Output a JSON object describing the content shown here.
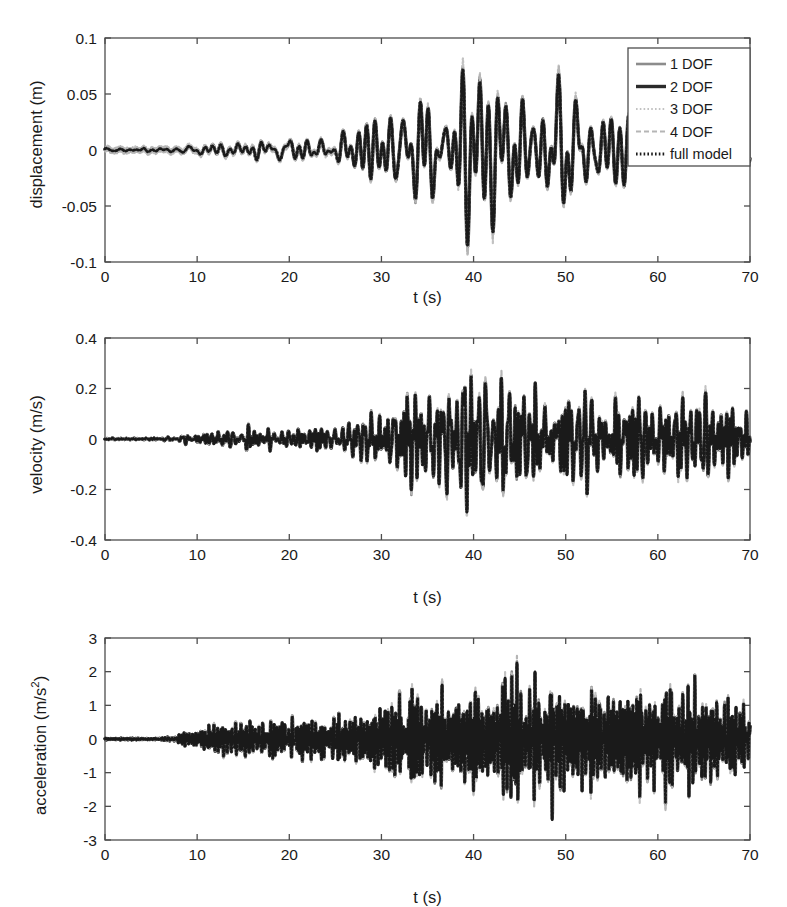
{
  "figure": {
    "background": "#ffffff",
    "axis_color": "#4d4d4d"
  },
  "legend": {
    "position": "top-right-panel-1",
    "entries": [
      {
        "label": "1 DOF",
        "color": "#8c8c8c",
        "style": "solid",
        "width": 2.6
      },
      {
        "label": "2 DOF",
        "color": "#2b2b2b",
        "style": "solid",
        "width": 3.4
      },
      {
        "label": "3 DOF",
        "color": "#c2c2c2",
        "style": "dotted",
        "width": 2.2
      },
      {
        "label": "4 DOF",
        "color": "#b5b5b5",
        "style": "dashed",
        "width": 2.2
      },
      {
        "label": "full model",
        "color": "#1a1a1a",
        "style": "dotted",
        "width": 2.8
      }
    ]
  },
  "chart_data": [
    {
      "type": "line",
      "title": "",
      "panel": 1,
      "xlabel": "t (s)",
      "ylabel": "displacement (m)",
      "xlim": [
        0,
        70
      ],
      "ylim": [
        -0.1,
        0.1
      ],
      "xticks": [
        0,
        10,
        20,
        30,
        40,
        50,
        60,
        70
      ],
      "xticklabels": [
        "0",
        "10",
        "20",
        "30",
        "40",
        "50",
        "60",
        "70"
      ],
      "yticks": [
        -0.1,
        -0.05,
        0,
        0.05,
        0.1
      ],
      "yticklabels": [
        "-0.1",
        "-0.05",
        "0",
        "0.05",
        "0.1"
      ],
      "grid": false,
      "legend_entries": [
        "1 DOF",
        "2 DOF",
        "3 DOF",
        "4 DOF",
        "full model"
      ],
      "description": "Near-zero until t=8s, slow growth to t=30s, strong irregular low-frequency oscillation peaking near t=36-39s with max +0.075 and min -0.085, decaying after t=58s.",
      "envelope": [
        {
          "t": 0,
          "amp": 0.0015
        },
        {
          "t": 6,
          "amp": 0.0015
        },
        {
          "t": 9,
          "amp": 0.004
        },
        {
          "t": 12,
          "amp": 0.007
        },
        {
          "t": 15,
          "amp": 0.01
        },
        {
          "t": 18,
          "amp": 0.012
        },
        {
          "t": 21,
          "amp": 0.011
        },
        {
          "t": 24,
          "amp": 0.013
        },
        {
          "t": 27,
          "amp": 0.014
        },
        {
          "t": 30,
          "amp": 0.022
        },
        {
          "t": 32,
          "amp": 0.048
        },
        {
          "t": 34,
          "amp": 0.04
        },
        {
          "t": 36,
          "amp": 0.07
        },
        {
          "t": 38,
          "amp": 0.062
        },
        {
          "t": 39,
          "amp": 0.085
        },
        {
          "t": 41,
          "amp": 0.055
        },
        {
          "t": 43,
          "amp": 0.045
        },
        {
          "t": 45,
          "amp": 0.052
        },
        {
          "t": 47,
          "amp": 0.04
        },
        {
          "t": 49,
          "amp": 0.046
        },
        {
          "t": 51,
          "amp": 0.036
        },
        {
          "t": 53,
          "amp": 0.04
        },
        {
          "t": 55,
          "amp": 0.03
        },
        {
          "t": 57,
          "amp": 0.033
        },
        {
          "t": 59,
          "amp": 0.016
        },
        {
          "t": 62,
          "amp": 0.013
        },
        {
          "t": 65,
          "amp": 0.011
        },
        {
          "t": 68,
          "amp": 0.012
        },
        {
          "t": 70,
          "amp": 0.01
        }
      ],
      "base_freq": 0.62,
      "seed": 17
    },
    {
      "type": "line",
      "title": "",
      "panel": 2,
      "xlabel": "t (s)",
      "ylabel": "velocity (m/s)",
      "xlim": [
        0,
        70
      ],
      "ylim": [
        -0.4,
        0.4
      ],
      "xticks": [
        0,
        10,
        20,
        30,
        40,
        50,
        60,
        70
      ],
      "xticklabels": [
        "0",
        "10",
        "20",
        "30",
        "40",
        "50",
        "60",
        "70"
      ],
      "yticks": [
        -0.4,
        -0.2,
        0,
        0.2,
        0.4
      ],
      "yticklabels": [
        "-0.4",
        "-0.2",
        "0",
        "0.2",
        "0.4"
      ],
      "grid": false,
      "description": "Flat until t=8s, moderate growth to t=30s, then dense oscillation with peaks near +0.29 around t=44 and troughs near -0.27, sustained through t=70.",
      "envelope": [
        {
          "t": 0,
          "amp": 0.004
        },
        {
          "t": 6,
          "amp": 0.004
        },
        {
          "t": 9,
          "amp": 0.02
        },
        {
          "t": 12,
          "amp": 0.035
        },
        {
          "t": 15,
          "amp": 0.05
        },
        {
          "t": 18,
          "amp": 0.055
        },
        {
          "t": 21,
          "amp": 0.05
        },
        {
          "t": 24,
          "amp": 0.06
        },
        {
          "t": 27,
          "amp": 0.07
        },
        {
          "t": 30,
          "amp": 0.11
        },
        {
          "t": 32,
          "amp": 0.21
        },
        {
          "t": 34,
          "amp": 0.18
        },
        {
          "t": 36,
          "amp": 0.23
        },
        {
          "t": 38,
          "amp": 0.2
        },
        {
          "t": 40,
          "amp": 0.225
        },
        {
          "t": 42,
          "amp": 0.2
        },
        {
          "t": 44,
          "amp": 0.29
        },
        {
          "t": 46,
          "amp": 0.21
        },
        {
          "t": 48,
          "amp": 0.235
        },
        {
          "t": 50,
          "amp": 0.2
        },
        {
          "t": 52,
          "amp": 0.215
        },
        {
          "t": 54,
          "amp": 0.185
        },
        {
          "t": 56,
          "amp": 0.2
        },
        {
          "t": 58,
          "amp": 0.175
        },
        {
          "t": 60,
          "amp": 0.185
        },
        {
          "t": 62,
          "amp": 0.165
        },
        {
          "t": 64,
          "amp": 0.18
        },
        {
          "t": 66,
          "amp": 0.16
        },
        {
          "t": 68,
          "amp": 0.175
        },
        {
          "t": 70,
          "amp": 0.15
        }
      ],
      "base_freq": 1.55,
      "seed": 41
    },
    {
      "type": "line",
      "title": "",
      "panel": 3,
      "xlabel": "t (s)",
      "ylabel": "acceleration (m/s2)",
      "ylabel_sup": "2",
      "ylabel_prefix": "acceleration (m/s",
      "ylabel_suffix": ")",
      "xlim": [
        0,
        70
      ],
      "ylim": [
        -3,
        3
      ],
      "xticks": [
        0,
        10,
        20,
        30,
        40,
        50,
        60,
        70
      ],
      "xticklabels": [
        "0",
        "10",
        "20",
        "30",
        "40",
        "50",
        "60",
        "70"
      ],
      "yticks": [
        -3,
        -2,
        -1,
        0,
        1,
        2,
        3
      ],
      "yticklabels": [
        "-3",
        "-2",
        "-1",
        "0",
        "1",
        "2",
        "3"
      ],
      "grid": false,
      "description": "Flat until t=8s, rapid high-frequency oscillation growing steadily; densest band from t=30 onward with peaks near +2.4 at t=49 and troughs near -2.3 at t=44, sustained to t=70.",
      "envelope": [
        {
          "t": 0,
          "amp": 0.03
        },
        {
          "t": 6,
          "amp": 0.03
        },
        {
          "t": 8,
          "amp": 0.15
        },
        {
          "t": 10,
          "amp": 0.4
        },
        {
          "t": 12,
          "amp": 0.55
        },
        {
          "t": 14,
          "amp": 0.6
        },
        {
          "t": 16,
          "amp": 0.55
        },
        {
          "t": 18,
          "amp": 0.65
        },
        {
          "t": 20,
          "amp": 0.6
        },
        {
          "t": 22,
          "amp": 0.7
        },
        {
          "t": 24,
          "amp": 0.75
        },
        {
          "t": 26,
          "amp": 0.8
        },
        {
          "t": 28,
          "amp": 1.0
        },
        {
          "t": 30,
          "amp": 1.3
        },
        {
          "t": 32,
          "amp": 1.55
        },
        {
          "t": 34,
          "amp": 1.45
        },
        {
          "t": 36,
          "amp": 1.7
        },
        {
          "t": 38,
          "amp": 1.6
        },
        {
          "t": 40,
          "amp": 1.85
        },
        {
          "t": 42,
          "amp": 1.75
        },
        {
          "t": 44,
          "amp": 2.3
        },
        {
          "t": 46,
          "amp": 1.9
        },
        {
          "t": 48,
          "amp": 2.1
        },
        {
          "t": 49,
          "amp": 2.4
        },
        {
          "t": 51,
          "amp": 1.95
        },
        {
          "t": 53,
          "amp": 2.05
        },
        {
          "t": 55,
          "amp": 1.85
        },
        {
          "t": 57,
          "amp": 2.0
        },
        {
          "t": 59,
          "amp": 1.8
        },
        {
          "t": 61,
          "amp": 1.95
        },
        {
          "t": 63,
          "amp": 1.75
        },
        {
          "t": 65,
          "amp": 1.9
        },
        {
          "t": 67,
          "amp": 1.7
        },
        {
          "t": 69,
          "amp": 1.85
        },
        {
          "t": 70,
          "amp": 1.6
        }
      ],
      "base_freq": 3.9,
      "seed": 73
    }
  ]
}
